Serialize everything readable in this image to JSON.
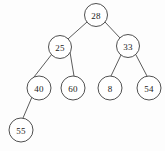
{
  "figure": {
    "type": "binary-search-tree-diagram",
    "background_color": "#fdfdfd",
    "node_fill_color": "#ffffff",
    "node_stroke_color": "#3c3c3c",
    "edge_color": "#4a4a4a",
    "label_color": "#1a1a1a",
    "width": 165,
    "height": 151
  },
  "tree": {
    "root_key": "28",
    "node_radius": 11.5,
    "nodes": [
      {
        "id": "n28",
        "label": "28",
        "cx": 96,
        "cy": 15,
        "r": 11.5,
        "level": 0,
        "parent": null
      },
      {
        "id": "n25",
        "label": "25",
        "cx": 60,
        "cy": 47,
        "r": 11.5,
        "level": 1,
        "parent": "n28",
        "side": "left"
      },
      {
        "id": "n33",
        "label": "33",
        "cx": 128,
        "cy": 46,
        "r": 11.5,
        "level": 1,
        "parent": "n28",
        "side": "right"
      },
      {
        "id": "n40",
        "label": "40",
        "cx": 39,
        "cy": 88,
        "r": 12,
        "level": 2,
        "parent": "n25",
        "side": "left"
      },
      {
        "id": "n60",
        "label": "60",
        "cx": 73,
        "cy": 88,
        "r": 12,
        "level": 2,
        "parent": "n25",
        "side": "right"
      },
      {
        "id": "n8",
        "label": "8",
        "cx": 110,
        "cy": 88,
        "r": 12,
        "level": 2,
        "parent": "n33",
        "side": "left"
      },
      {
        "id": "n54",
        "label": "54",
        "cx": 149,
        "cy": 88,
        "r": 12,
        "level": 2,
        "parent": "n33",
        "side": "right"
      },
      {
        "id": "n55",
        "label": "55",
        "cx": 21,
        "cy": 130,
        "r": 12,
        "level": 3,
        "parent": "n40",
        "side": "left"
      }
    ],
    "edges": [
      {
        "id": "e28-25",
        "from": "n28",
        "to": "n25",
        "x1": 87,
        "y1": 22,
        "x2": 68,
        "y2": 39
      },
      {
        "id": "e28-33",
        "from": "n28",
        "to": "n33",
        "x1": 105,
        "y1": 22,
        "x2": 120,
        "y2": 38
      },
      {
        "id": "e25-40",
        "from": "n25",
        "to": "n40",
        "x1": 52,
        "y1": 54,
        "x2": 34,
        "y2": 77
      },
      {
        "id": "e25-60",
        "from": "n25",
        "to": "n60",
        "x1": 70,
        "y1": 52,
        "x2": 74,
        "y2": 76
      },
      {
        "id": "e33-8",
        "from": "n33",
        "to": "n8",
        "x1": 121,
        "y1": 55,
        "x2": 111,
        "y2": 76
      },
      {
        "id": "e33-54",
        "from": "n33",
        "to": "n54",
        "x1": 136,
        "y1": 55,
        "x2": 147,
        "y2": 76
      },
      {
        "id": "e40-55",
        "from": "n40",
        "to": "n55",
        "x1": 32,
        "y1": 97,
        "x2": 23,
        "y2": 118
      }
    ]
  }
}
